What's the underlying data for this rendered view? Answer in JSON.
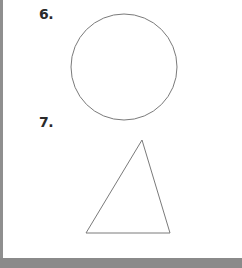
{
  "problems": [
    {
      "number": "6.",
      "shape": "circle",
      "center": [
        124,
        67
      ],
      "radius": 53
    },
    {
      "number": "7.",
      "shape": "triangle",
      "vertices": [
        [
          142,
          140
        ],
        [
          86,
          233
        ],
        [
          170,
          233
        ]
      ]
    }
  ],
  "colors": {
    "stroke": "#7a7a7a",
    "border": "#8f8f8f",
    "bottom_bar": "#8a8a8a",
    "text": "#2a2a2a"
  }
}
